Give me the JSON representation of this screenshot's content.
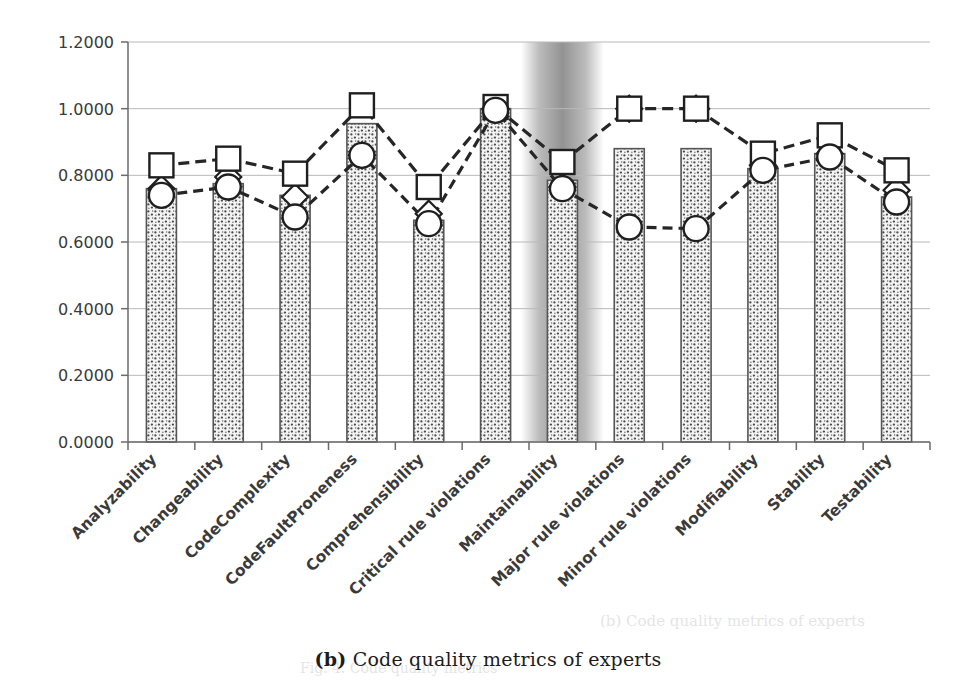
{
  "caption": {
    "label": "(b)",
    "text": "Code quality metrics of experts"
  },
  "bleed_through": {
    "line_top": "(b) Code quality metrics of experts",
    "line_bottom": "Fig. 4. Code quality metrics"
  },
  "legend": {
    "position": "bottom",
    "items": [
      {
        "key": "average",
        "label": "expert average",
        "marker": "hatched-bar-swatch"
      },
      {
        "key": "maximum",
        "label": "expert maximum",
        "marker": "dashed-line-square"
      },
      {
        "key": "minimum",
        "label": "expert minimum",
        "marker": "dashed-line-circle"
      },
      {
        "key": "median",
        "label": "expert median",
        "marker": "diamond"
      }
    ]
  },
  "colors": {
    "axis": "#6b6b6b",
    "grid": "#b9b9b9",
    "bar_outline": "#555555",
    "bar_fill": "#f2f2f2",
    "marker_fill": "#ffffff",
    "marker_outline": "#1f1f1f",
    "line": "#262626",
    "highlight_band": "#9a9a9a",
    "text": "#3a3a3a",
    "caption_text": "#1c1c1c"
  },
  "chart_data": {
    "type": "bar",
    "title": "",
    "subtitle": "",
    "xlabel": "",
    "ylabel": "",
    "ylim": [
      0.0,
      1.2
    ],
    "yticks": [
      0.0,
      0.2,
      0.4,
      0.6,
      0.8,
      1.0,
      1.2
    ],
    "ytick_labels": [
      "0.0000",
      "0.2000",
      "0.4000",
      "0.6000",
      "0.8000",
      "1.0000",
      "1.2000"
    ],
    "grid": true,
    "legend_position": "bottom",
    "highlight_category": "Maintainability",
    "categories": [
      "Analyzability",
      "Changeability",
      "CodeComplexity",
      "CodeFaultProneness",
      "Comprehensibility",
      "Critical rule violations",
      "Maintainability",
      "Major rule violations",
      "Minor rule violations",
      "Modifiability",
      "Stability",
      "Testability"
    ],
    "series": [
      {
        "name": "expert average",
        "type": "bar",
        "values": [
          0.76,
          0.775,
          0.74,
          0.955,
          0.665,
          1.0,
          0.785,
          0.88,
          0.88,
          0.82,
          0.865,
          0.735
        ]
      },
      {
        "name": "expert maximum",
        "type": "line",
        "marker": "square",
        "values": [
          0.83,
          0.85,
          0.805,
          1.01,
          0.765,
          1.005,
          0.84,
          1.0,
          1.0,
          0.865,
          0.92,
          0.815
        ]
      },
      {
        "name": "expert minimum",
        "type": "line",
        "marker": "circle",
        "values": [
          0.74,
          0.765,
          0.675,
          0.86,
          0.655,
          0.995,
          0.76,
          0.645,
          0.64,
          0.815,
          0.855,
          0.72
        ]
      },
      {
        "name": "expert median",
        "type": "scatter",
        "marker": "diamond",
        "values": [
          0.76,
          0.795,
          0.735,
          0.86,
          0.685,
          1.0,
          0.765,
          1.0,
          1.0,
          0.83,
          0.865,
          0.755
        ]
      }
    ]
  }
}
